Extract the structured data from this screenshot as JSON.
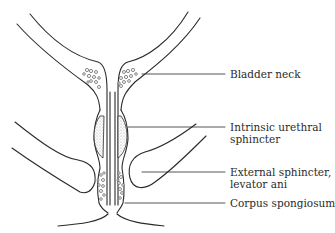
{
  "diagram": {
    "stroke_color": "#2a2a2a",
    "stipple_color": "#bdbdbd",
    "labels": [
      {
        "id": "bladder-neck",
        "lines": [
          "Bladder neck"
        ]
      },
      {
        "id": "intrinsic-urethral-sphincter",
        "lines": [
          "Intrinsic urethral",
          "sphincter"
        ]
      },
      {
        "id": "external-sphincter",
        "lines": [
          "External sphincter,",
          "levator ani"
        ]
      },
      {
        "id": "corpus-spongiosum",
        "lines": [
          "Corpus spongiosum"
        ]
      }
    ]
  }
}
